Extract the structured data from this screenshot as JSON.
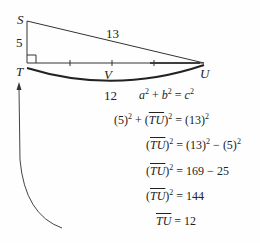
{
  "diagram": {
    "points": {
      "S": {
        "label": "S"
      },
      "T": {
        "label": "T"
      },
      "U": {
        "label": "U"
      },
      "V": {
        "label": "V"
      }
    },
    "side_labels": {
      "ST": "5",
      "SU": "13",
      "TU": "12"
    }
  },
  "equations": [
    {
      "lhs": "a² + b² = c²"
    },
    {
      "lhs": "(5)² + (TU)² = (13)²"
    },
    {
      "lhs": "(TU)² = (13)² − (5)²"
    },
    {
      "lhs": "(TU)² = 169 − 25"
    },
    {
      "lhs": "(TU)² = 144"
    },
    {
      "lhs": "TU = 12"
    }
  ],
  "eq_parts": {
    "e1": {
      "a": "a",
      "b": "b",
      "c": "c",
      "plus": " + ",
      "eq": " = "
    },
    "e2": {
      "pre": "(5)",
      "plus": " + ",
      "seg": "TU",
      "eq": " = (13)"
    },
    "e3": {
      "seg": "TU",
      "eq": " = (13)",
      "minus": " − (5)"
    },
    "e4": {
      "seg": "TU",
      "rhs": " = 169 − 25"
    },
    "e5": {
      "seg": "TU",
      "rhs": " = 144"
    },
    "e6": {
      "seg": "TU",
      "rhs": " = 12"
    },
    "sq": "2"
  }
}
